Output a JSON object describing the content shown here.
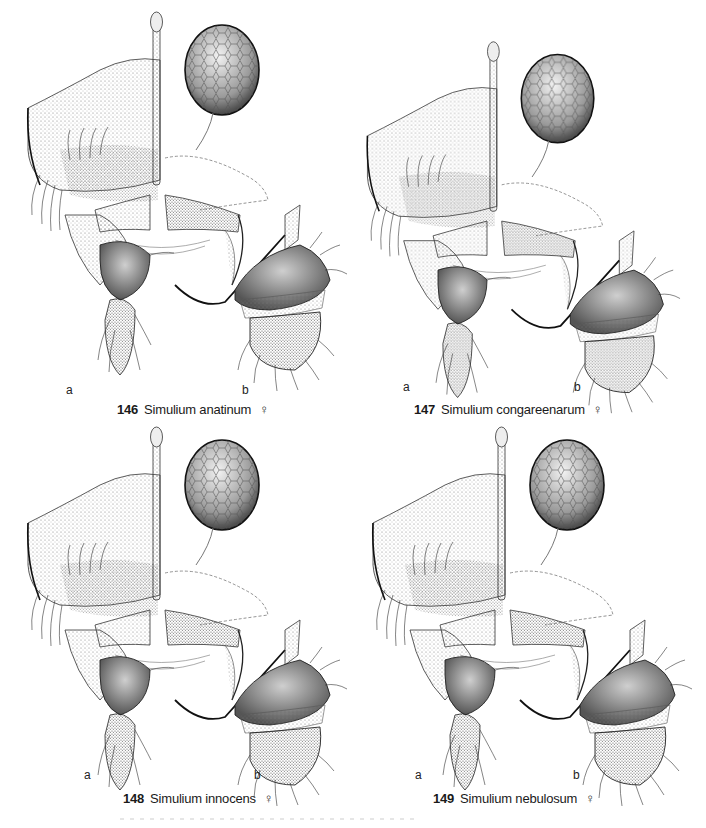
{
  "figure": {
    "type": "taxonomic illustration plate",
    "plates": [
      {
        "number": "146",
        "species": "Simulium anatinum",
        "sex_symbol": "♀",
        "panel_a": "a",
        "panel_b": "b"
      },
      {
        "number": "147",
        "species": "Simulium congareenarum",
        "sex_symbol": "♀",
        "panel_a": "a",
        "panel_b": "b"
      },
      {
        "number": "148",
        "species": "Simulium innocens",
        "sex_symbol": "♀",
        "panel_a": "a",
        "panel_b": "b"
      },
      {
        "number": "149",
        "species": "Simulium nebulosum",
        "sex_symbol": "♀",
        "panel_a": "a",
        "panel_b": "b"
      }
    ]
  },
  "colors": {
    "ink": "#1a1a1a",
    "stipple": "#555555",
    "background": "#ffffff"
  }
}
